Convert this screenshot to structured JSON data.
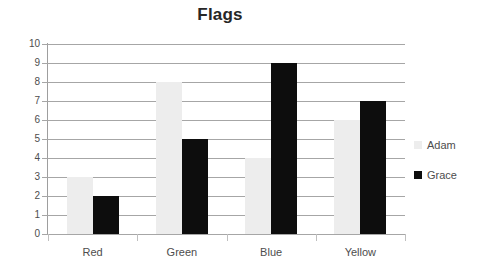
{
  "chart_data": {
    "type": "bar",
    "title": "Flags",
    "xlabel": "",
    "ylabel": "",
    "ylim": [
      0,
      10
    ],
    "ytick_step": 1,
    "yticks": [
      10,
      9,
      8,
      7,
      6,
      5,
      4,
      3,
      2,
      1,
      0
    ],
    "grid": true,
    "legend_position": "right",
    "categories": [
      "Red",
      "Green",
      "Blue",
      "Yellow"
    ],
    "series": [
      {
        "name": "Adam",
        "color": "#ededed",
        "values": [
          3,
          8,
          4,
          6
        ]
      },
      {
        "name": "Grace",
        "color": "#0d0d0d",
        "values": [
          2,
          5,
          9,
          7
        ]
      }
    ]
  },
  "legend": {
    "items": [
      {
        "label": "Adam",
        "swatch_name": "legend-swatch-adam"
      },
      {
        "label": "Grace",
        "swatch_name": "legend-swatch-grace"
      }
    ]
  }
}
